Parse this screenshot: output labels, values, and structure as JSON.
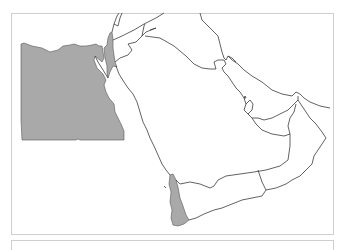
{
  "map": {
    "region": "Middle East / Arabian Peninsula",
    "highlight_color": "#a9a9a9",
    "border_color": "#3a3a3a",
    "frame_color": "#cfcfcf",
    "highlighted_regions": [
      "Egypt",
      "Israel/Palestine",
      "Western Yemen (Tihamah coast)"
    ],
    "outlined_regions": [
      "Jordan",
      "Syria",
      "Iraq",
      "Saudi Arabia",
      "Kuwait",
      "Bahrain",
      "Qatar",
      "United Arab Emirates",
      "Oman",
      "Yemen",
      "Iran (coast)"
    ]
  }
}
